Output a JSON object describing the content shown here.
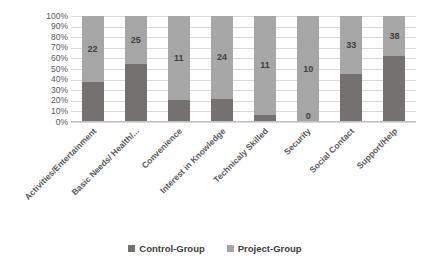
{
  "chart_data": {
    "type": "bar",
    "subtype": "100% stacked column",
    "title": "",
    "xlabel": "",
    "ylabel": "",
    "ylim": [
      0,
      100
    ],
    "ytick_labels": [
      "100%",
      "90%",
      "80%",
      "70%",
      "60%",
      "50%",
      "40%",
      "30%",
      "20%",
      "10%",
      "0%"
    ],
    "ytick_values": [
      100,
      90,
      80,
      70,
      60,
      50,
      40,
      30,
      20,
      10,
      0
    ],
    "grid": true,
    "legend_position": "bottom",
    "categories": [
      "Activities/Entertainment",
      "Basic Needs/ Health/...",
      "Convenience",
      "Interest in Knowledge",
      "Technicaly Skilled",
      "Security",
      "Social Contact",
      "Support/Help"
    ],
    "series": [
      {
        "name": "Control-Group",
        "color": "#767171",
        "percent_values": [
          38,
          55,
          21,
          22,
          7,
          0,
          45,
          62
        ],
        "data_labels": [
          "",
          "",
          "",
          "",
          "",
          "0",
          "",
          ""
        ]
      },
      {
        "name": "Project-Group",
        "color": "#a6a6a6",
        "percent_values": [
          62,
          45,
          79,
          78,
          93,
          100,
          55,
          38
        ],
        "data_labels": [
          "22",
          "25",
          "11",
          "24",
          "11",
          "10",
          "33",
          "38"
        ]
      }
    ]
  },
  "legend": {
    "items": [
      {
        "label": "Control-Group",
        "color": "#767171"
      },
      {
        "label": "Project-Group",
        "color": "#a6a6a6"
      }
    ]
  },
  "colors": {
    "control_group": "#767171",
    "project_group": "#a6a6a6",
    "gridline": "#d9d9d9",
    "text": "#595959",
    "background": "#ffffff"
  }
}
